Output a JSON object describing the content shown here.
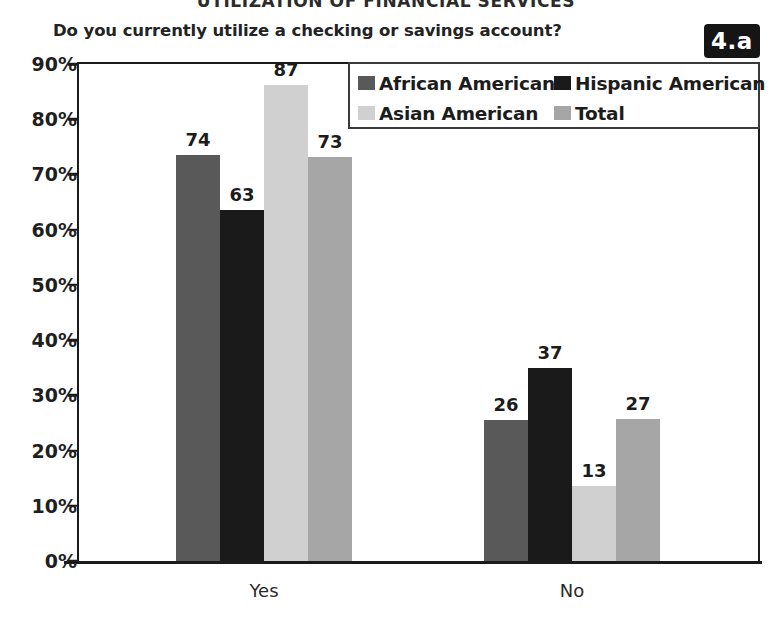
{
  "report_header": "UTILIZATION OF FINANCIAL SERVICES",
  "figure_badge": "4.a",
  "question": "Do you currently utilize a checking or savings account?",
  "legend": {
    "items": [
      {
        "label": "African American",
        "color": "#595959"
      },
      {
        "label": "Hispanic American",
        "color": "#1a1a1a"
      },
      {
        "label": "Asian American",
        "color": "#d0d0d0"
      },
      {
        "label": "Total",
        "color": "#a6a6a6"
      }
    ]
  },
  "chart_data": {
    "type": "bar",
    "title": "Do you currently utilize a checking or savings account?",
    "xlabel": "",
    "ylabel": "",
    "ylim": [
      0,
      90
    ],
    "grid": false,
    "legend_position": "top-right",
    "categories": [
      "Yes",
      "No"
    ],
    "y_ticks": [
      "0%",
      "10%",
      "20%",
      "30%",
      "40%",
      "50%",
      "60%",
      "70%",
      "80%",
      "90%"
    ],
    "y_tick_values": [
      0,
      10,
      20,
      30,
      40,
      50,
      60,
      70,
      80,
      90
    ],
    "series": [
      {
        "name": "African American",
        "color": "#595959",
        "values": [
          74,
          26
        ],
        "plotted": [
          73.5,
          25.5
        ]
      },
      {
        "name": "Hispanic American",
        "color": "#1a1a1a",
        "values": [
          63,
          37
        ],
        "plotted": [
          63.5,
          35.0
        ]
      },
      {
        "name": "Asian American",
        "color": "#d0d0d0",
        "values": [
          87,
          13
        ],
        "plotted": [
          86.2,
          13.5
        ]
      },
      {
        "name": "Total",
        "color": "#a6a6a6",
        "values": [
          73,
          27
        ],
        "plotted": [
          73.2,
          25.8
        ]
      }
    ],
    "data_labels": {
      "Yes": [
        "74",
        "63",
        "87",
        "73"
      ],
      "No": [
        "26",
        "37",
        "13",
        "27"
      ]
    }
  }
}
